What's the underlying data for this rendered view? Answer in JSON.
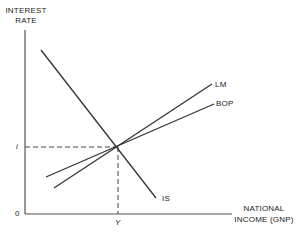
{
  "diagram": {
    "type": "IS-LM-BOP diagram",
    "y_axis_label_line1": "INTEREST",
    "y_axis_label_line2": "RATE",
    "x_axis_label_line1": "NATIONAL",
    "x_axis_label_line2": "INCOME (GNP)",
    "origin_label": "0",
    "equilibrium_interest_label": "i",
    "equilibrium_income_label": "Y",
    "curves": [
      {
        "name": "IS",
        "label": "IS",
        "slope": "downward"
      },
      {
        "name": "LM",
        "label": "LM",
        "slope": "upward, steeper"
      },
      {
        "name": "BOP",
        "label": "BOP",
        "slope": "upward, flatter"
      }
    ],
    "line_color": "#333333"
  }
}
